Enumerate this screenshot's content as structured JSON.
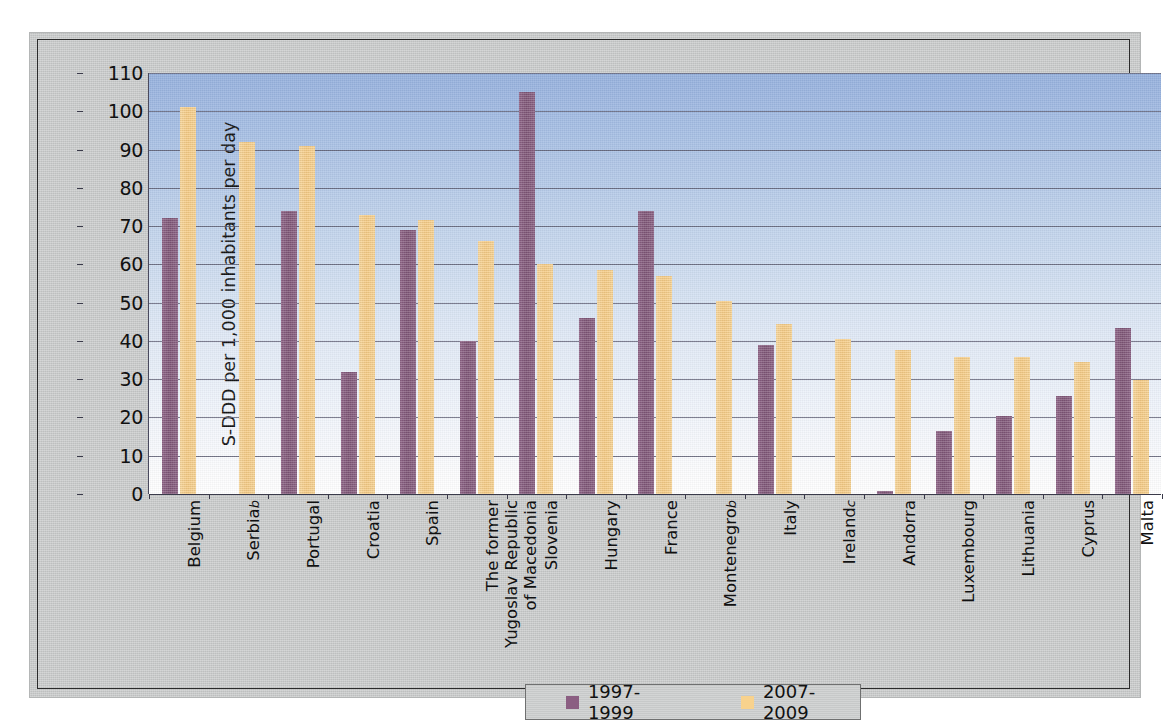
{
  "chart_data": {
    "type": "bar",
    "title": "",
    "subtitle": "",
    "xlabel": "",
    "ylabel": "S-DDD per 1,000 inhabitants per day",
    "ylim": [
      0,
      110
    ],
    "ytick_step": 10,
    "yticks": [
      "110",
      "100",
      "90",
      "80",
      "70",
      "60",
      "50",
      "40",
      "30",
      "20",
      "10",
      "0"
    ],
    "grid": true,
    "legend_position": "bottom-center",
    "categories": [
      "Belgium",
      "Serbia",
      "Portugal",
      "Croatia",
      "Spain",
      "The former Yugoslav Republic of Macedonia",
      "Slovenia",
      "Hungary",
      "France",
      "Montenegro",
      "Italy",
      "Ireland",
      "Andorra",
      "Luxembourg",
      "Lithuania",
      "Cyprus",
      "Malta"
    ],
    "category_labels": [
      {
        "lines": [
          "Belgium"
        ],
        "footnote": ""
      },
      {
        "lines": [
          "Serbia"
        ],
        "footnote": "b"
      },
      {
        "lines": [
          "Portugal"
        ],
        "footnote": ""
      },
      {
        "lines": [
          "Croatia"
        ],
        "footnote": ""
      },
      {
        "lines": [
          "Spain"
        ],
        "footnote": ""
      },
      {
        "lines": [
          "The former",
          "Yugoslav Republic",
          "of Macedonia"
        ],
        "footnote": ""
      },
      {
        "lines": [
          "Slovenia"
        ],
        "footnote": ""
      },
      {
        "lines": [
          "Hungary"
        ],
        "footnote": ""
      },
      {
        "lines": [
          "France"
        ],
        "footnote": ""
      },
      {
        "lines": [
          "Montenegro"
        ],
        "footnote": "b"
      },
      {
        "lines": [
          "Italy"
        ],
        "footnote": ""
      },
      {
        "lines": [
          "Ireland"
        ],
        "footnote": "c"
      },
      {
        "lines": [
          "Andorra"
        ],
        "footnote": ""
      },
      {
        "lines": [
          "Luxembourg"
        ],
        "footnote": ""
      },
      {
        "lines": [
          "Lithuania"
        ],
        "footnote": ""
      },
      {
        "lines": [
          "Cyprus"
        ],
        "footnote": ""
      },
      {
        "lines": [
          "Malta"
        ],
        "footnote": ""
      }
    ],
    "series": [
      {
        "name": "1997-1999",
        "color": "#8b5e82",
        "values": [
          72,
          null,
          74,
          32,
          69,
          40,
          105,
          46,
          74,
          null,
          39,
          null,
          0.8,
          16.5,
          20.5,
          25.7,
          43.5
        ]
      },
      {
        "name": "2007-2009",
        "color": "#f8d28d",
        "values": [
          101,
          92,
          91,
          73,
          71.5,
          66,
          60,
          58.5,
          57,
          50.5,
          44.5,
          40.5,
          37.5,
          35.7,
          35.8,
          34.5,
          29.7
        ]
      }
    ]
  },
  "legend": {
    "entries": [
      {
        "label": "1997-1999",
        "color": "#8b5e82"
      },
      {
        "label": "2007-2009",
        "color": "#f8d28d"
      }
    ]
  },
  "axis": {
    "y_title": "S-DDD per 1,000 inhabitants per day"
  }
}
